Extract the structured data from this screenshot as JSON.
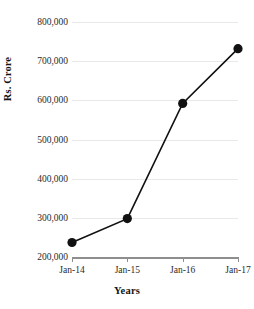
{
  "chart_data": {
    "type": "line",
    "title": "",
    "subtitle": "",
    "xlabel": "Years",
    "ylabel": "Rs. Crore",
    "categories": [
      "Jan-14",
      "Jan-15",
      "Jan-16",
      "Jan-17"
    ],
    "values": [
      237000,
      298000,
      592000,
      732000
    ],
    "series": [
      {
        "name": "Rs. Crore",
        "values": [
          237000,
          298000,
          592000,
          732000
        ]
      }
    ],
    "ylim": [
      200000,
      800000
    ],
    "ytick_values": [
      200000,
      300000,
      400000,
      500000,
      600000,
      700000,
      800000
    ],
    "ytick_labels": [
      "200,000",
      "300,000",
      "400,000",
      "500,000",
      "600,000",
      "700,000",
      "800,000"
    ],
    "xtick_labels": [
      "Jan-14",
      "Jan-15",
      "Jan-16",
      "Jan-17"
    ],
    "grid": true,
    "grid_axis": "y",
    "legend": false,
    "legend_position": "none",
    "annotations": [],
    "style": {
      "background_color": "#ffffff",
      "line_color": "#111111",
      "marker_color": "#111111",
      "marker_shape": "circle",
      "gridline_color": "#e9e9ea",
      "axis_line_color": "#8e8e8e",
      "text_color": "#1a1a1a"
    }
  },
  "axes": {
    "y_title": "Rs. Crore",
    "x_title": "Years"
  }
}
